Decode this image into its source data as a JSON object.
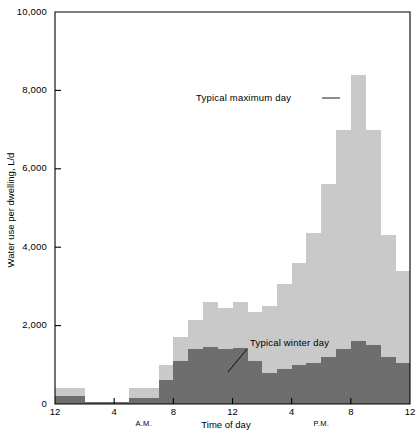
{
  "chart_data": {
    "type": "bar",
    "title": "",
    "xlabel": "Time of day",
    "ylabel": "Water use per dwelling, L/d",
    "ylim": [
      0,
      10000
    ],
    "xlim": [
      0,
      24
    ],
    "grid": false,
    "legend_position": "inline-annotations",
    "y_ticks": [
      0,
      2000,
      4000,
      6000,
      8000,
      10000
    ],
    "y_tick_labels": [
      "0",
      "2,000",
      "4,000",
      "6,000",
      "8,000",
      "10,000"
    ],
    "x_ticks": [
      0,
      4,
      8,
      12,
      16,
      20,
      24
    ],
    "x_tick_labels": [
      "12",
      "4",
      "8",
      "12",
      "4",
      "8",
      "12"
    ],
    "x_period_labels": [
      {
        "text": "A.M.",
        "x": 6
      },
      {
        "text": "P.M.",
        "x": 18
      }
    ],
    "categories": [
      "0",
      "1",
      "2",
      "3",
      "4",
      "5",
      "6",
      "7",
      "8",
      "9",
      "10",
      "11",
      "12",
      "13",
      "14",
      "15",
      "16",
      "17",
      "18",
      "19",
      "20",
      "21",
      "22",
      "23"
    ],
    "series": [
      {
        "name": "Typical maximum day",
        "color": "#c9c9c9",
        "values": [
          400,
          400,
          60,
          60,
          60,
          420,
          420,
          1000,
          1700,
          2150,
          2600,
          2450,
          2600,
          2350,
          2500,
          3050,
          3600,
          4350,
          5600,
          7000,
          8400,
          7000,
          4300,
          3400
        ]
      },
      {
        "name": "Typical winter day",
        "color": "#6e6e6e",
        "values": [
          200,
          200,
          40,
          40,
          40,
          150,
          150,
          620,
          1100,
          1400,
          1450,
          1400,
          1420,
          1100,
          800,
          900,
          1000,
          1050,
          1200,
          1400,
          1600,
          1500,
          1200,
          1050
        ]
      }
    ],
    "annotations": [
      {
        "text": "Typical maximum day",
        "series": "Typical maximum day",
        "text_x": 196,
        "text_y": 101,
        "leader": {
          "x1": 322,
          "y1": 98,
          "x2": 340,
          "y2": 98
        }
      },
      {
        "text": "Typical winter day",
        "series": "Typical winter day",
        "text_x": 250,
        "text_y": 346,
        "leader": {
          "x1": 247,
          "y1": 349,
          "x2": 228,
          "y2": 372
        }
      }
    ]
  }
}
